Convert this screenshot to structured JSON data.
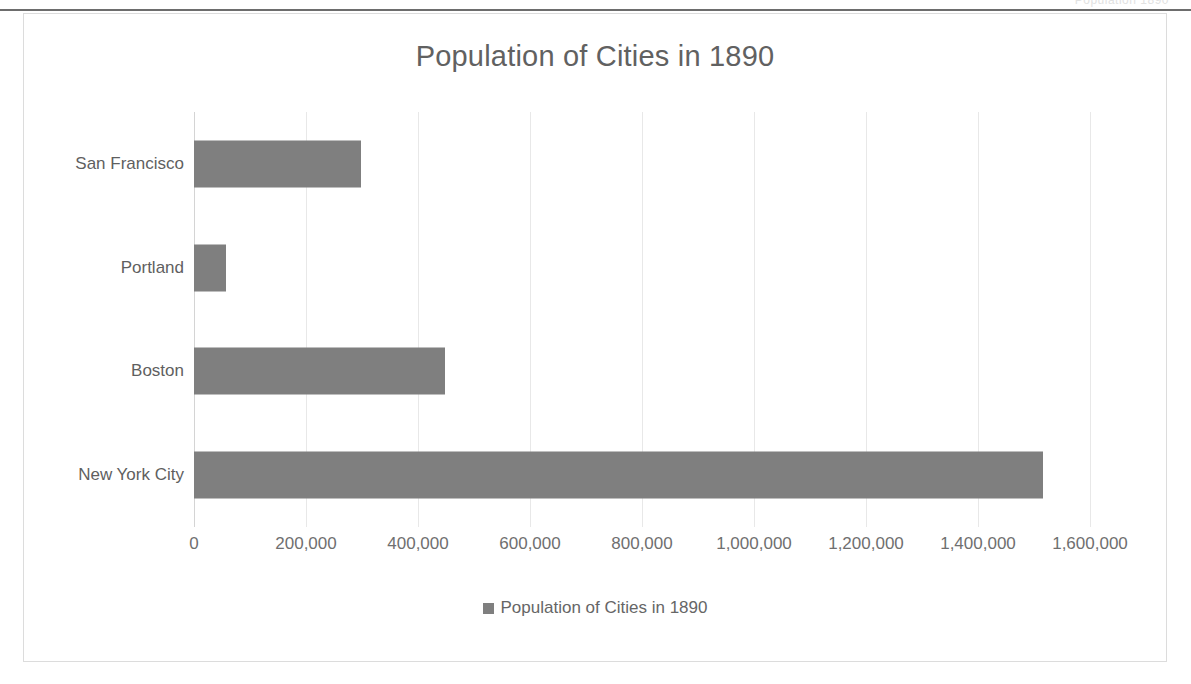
{
  "page": {
    "top_ghost_text": "Population  1890"
  },
  "chart_data": {
    "type": "bar",
    "orientation": "horizontal",
    "title": "Population of Cities in 1890",
    "xlabel": "",
    "ylabel": "",
    "categories": [
      "New York City",
      "Boston",
      "Portland",
      "San Francisco"
    ],
    "values": [
      1515301,
      448477,
      57000,
      298997
    ],
    "series": [
      {
        "name": "Population of Cities in 1890",
        "color": "#7f7f7f",
        "values": [
          1515301,
          448477,
          57000,
          298997
        ]
      }
    ],
    "xlim": [
      0,
      1600000
    ],
    "xticks": [
      0,
      200000,
      400000,
      600000,
      800000,
      1000000,
      1200000,
      1400000,
      1600000
    ],
    "xtick_labels": [
      "0",
      "200,000",
      "400,000",
      "600,000",
      "800,000",
      "1,000,000",
      "1,200,000",
      "1,400,000",
      "1,600,000"
    ],
    "grid": "vertical",
    "legend": {
      "position": "bottom",
      "entries": [
        {
          "label": "Population of Cities in 1890",
          "color": "#7f7f7f"
        }
      ]
    }
  },
  "colors": {
    "bar": "#7f7f7f",
    "title_text": "#616161",
    "axis_text": "#6f6f6f",
    "gridline": "#e8e8e8",
    "frame_border": "#dcdcdc",
    "page_rule": "#6d6d6d"
  }
}
